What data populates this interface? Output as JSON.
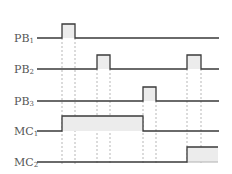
{
  "diagram": {
    "type": "timing-diagram",
    "signals": [
      {
        "name": "PB",
        "sub": "1",
        "low_y": 38,
        "high_y": 24,
        "pulses": [
          [
            62,
            75
          ]
        ]
      },
      {
        "name": "PB",
        "sub": "2",
        "low_y": 69,
        "high_y": 55,
        "pulses": [
          [
            97,
            110
          ],
          [
            187,
            201
          ]
        ]
      },
      {
        "name": "PB",
        "sub": "3",
        "low_y": 101,
        "high_y": 87,
        "pulses": [
          [
            143,
            156
          ]
        ]
      },
      {
        "name": "MC",
        "sub": "1",
        "low_y": 131,
        "high_y": 116,
        "pulses": [
          [
            62,
            143
          ]
        ]
      },
      {
        "name": "MC",
        "sub": "2",
        "low_y": 162,
        "high_y": 147,
        "pulses": [
          [
            187,
            218
          ]
        ]
      }
    ],
    "line_start_x": 37,
    "line_end_x": 219,
    "guide_x": [
      62,
      75,
      97,
      110,
      143,
      156,
      187,
      201
    ]
  }
}
